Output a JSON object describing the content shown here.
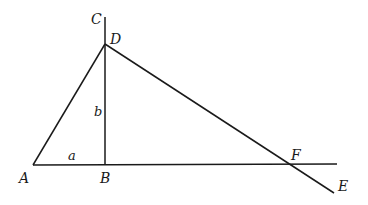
{
  "diagram": {
    "points": {
      "A": {
        "label": "A",
        "x": 33,
        "y": 165,
        "label_x": 19,
        "label_y": 183
      },
      "B": {
        "label": "B",
        "x": 105,
        "y": 165,
        "label_x": 100,
        "label_y": 183
      },
      "C": {
        "label": "C",
        "x": 105,
        "y": 17,
        "label_x": 91,
        "label_y": 24
      },
      "D": {
        "label": "D",
        "x": 105,
        "y": 44,
        "label_x": 110,
        "label_y": 44
      },
      "E": {
        "label": "E",
        "x": 334,
        "y": 193,
        "label_x": 338,
        "label_y": 191
      },
      "F": {
        "label": "F",
        "x": 290,
        "y": 164,
        "label_x": 291,
        "label_y": 160
      }
    },
    "segment_labels": {
      "a": {
        "label": "a",
        "x": 68,
        "y": 160
      },
      "b": {
        "label": "b",
        "x": 94,
        "y": 116
      }
    },
    "lines": [
      {
        "name": "line-A-horizontal",
        "x1": 33,
        "y1": 165,
        "x2": 337,
        "y2": 164
      },
      {
        "name": "line-C-B-vertical",
        "x1": 105,
        "y1": 17,
        "x2": 105,
        "y2": 165
      },
      {
        "name": "line-A-D",
        "x1": 33,
        "y1": 165,
        "x2": 105,
        "y2": 44
      },
      {
        "name": "line-D-E",
        "x1": 105,
        "y1": 44,
        "x2": 334,
        "y2": 193
      }
    ]
  }
}
